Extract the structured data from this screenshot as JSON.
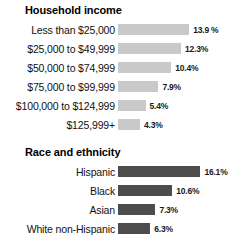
{
  "chart_data": [
    {
      "type": "bar",
      "orientation": "horizontal",
      "title": "Household income",
      "xlabel": "",
      "ylabel": "",
      "grid": false,
      "legend": "none",
      "bar_color": "#c9c9c9",
      "value_suffix": "%",
      "xlim": [
        0,
        17
      ],
      "categories": [
        "Less than $25,000",
        "$25,000 to $49,999",
        "$50,000 to $74,999",
        "$75,000 to $99,999",
        "$100,000 to $124,999",
        "$125,999+"
      ],
      "values": [
        13.9,
        12.3,
        10.4,
        7.9,
        5.4,
        4.3
      ],
      "value_labels": [
        "13.9 %",
        "12.3%",
        "10.4%",
        "7.9%",
        "5.4%",
        "4.3%"
      ]
    },
    {
      "type": "bar",
      "orientation": "horizontal",
      "title": "Race and ethnicity",
      "xlabel": "",
      "ylabel": "",
      "grid": false,
      "legend": "none",
      "bar_color": "#4d4d4d",
      "value_suffix": "%",
      "xlim": [
        0,
        17
      ],
      "categories": [
        "Hispanic",
        "Black",
        "Asian",
        "White non-Hispanic"
      ],
      "values": [
        16.1,
        10.6,
        7.3,
        6.3
      ],
      "value_labels": [
        "16.1%",
        "10.6%",
        "7.3%",
        "6.3%"
      ]
    }
  ]
}
